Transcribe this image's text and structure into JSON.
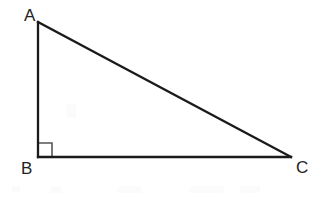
{
  "figure": {
    "type": "right-triangle-diagram",
    "background_color": "#ffffff",
    "stroke_color": "#1a1a1a",
    "stroke_width": 2.3,
    "label_color": "#232323",
    "right_angle_marker": {
      "at_vertex": "B",
      "color": "#555555",
      "stroke_width": 1.6,
      "size": 14
    },
    "vertices": [
      {
        "name": "A",
        "label": "A",
        "x": 38,
        "y": 22,
        "label_x": 24,
        "label_y": 7
      },
      {
        "name": "B",
        "label": "B",
        "x": 38,
        "y": 157,
        "label_x": 21,
        "label_y": 160
      },
      {
        "name": "C",
        "label": "C",
        "x": 291,
        "y": 157,
        "label_x": 296,
        "label_y": 159
      }
    ],
    "edges": [
      {
        "name": "AB",
        "from": "A",
        "to": "B",
        "role": "vertical-leg"
      },
      {
        "name": "BC",
        "from": "B",
        "to": "C",
        "role": "horizontal-leg"
      },
      {
        "name": "AC",
        "from": "A",
        "to": "C",
        "role": "hypotenuse"
      }
    ]
  }
}
